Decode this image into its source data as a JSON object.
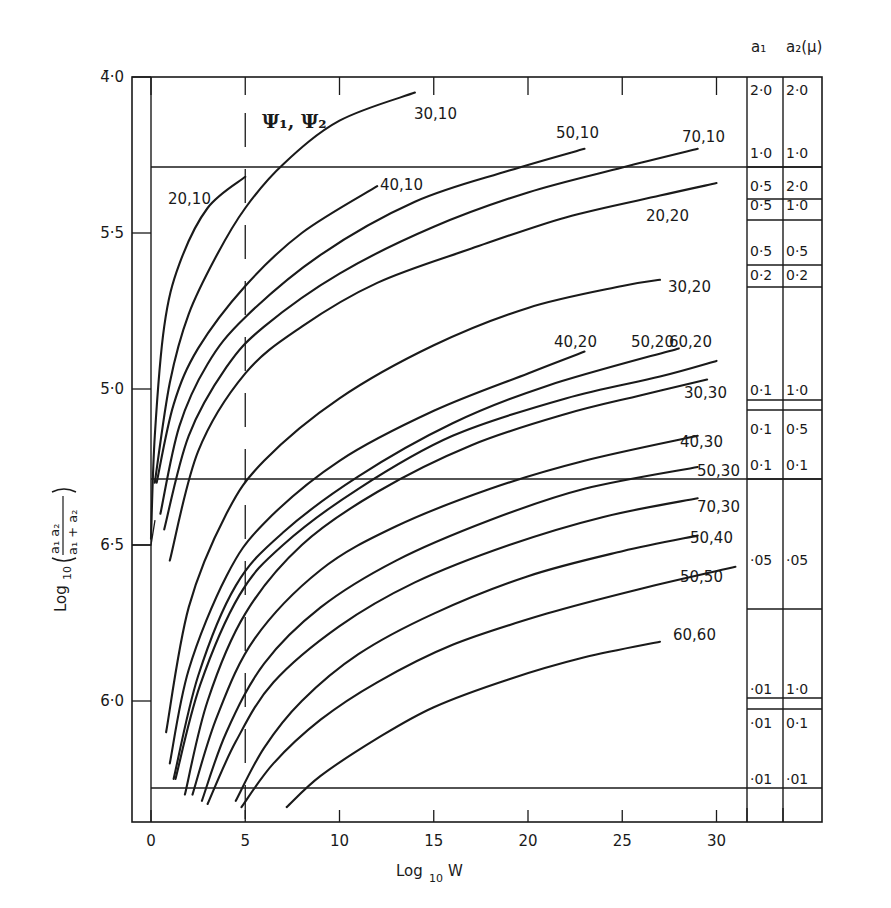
{
  "chart_data": {
    "type": "line",
    "title": "",
    "xlabel": "Log10 W",
    "ylabel": "Log10(a1 a2 / (a1 + a2))",
    "xlim": [
      0,
      33
    ],
    "x_ticks": [
      0,
      5,
      10,
      15,
      20,
      25,
      30
    ],
    "x_tick_labels": [
      "0",
      "5",
      "10",
      "15",
      "20",
      "25",
      "30"
    ],
    "y_ticks": [
      {
        "value": -4.0,
        "label": "4̄·0"
      },
      {
        "value": -4.5,
        "label": "5̄·5"
      },
      {
        "value": -5.0,
        "label": "5̄·0"
      },
      {
        "value": -5.5,
        "label": "6̄·5"
      },
      {
        "value": -6.0,
        "label": "6̄·0"
      }
    ],
    "ylim": [
      -6.39,
      -4.0
    ],
    "annotation": "Ψ1, Ψ2",
    "dashed_vertical_line_x": 5,
    "horizontal_reference_lines_y": [
      -4.29,
      -5.29,
      -6.28
    ],
    "series": [
      {
        "name": "20,10",
        "label": "20,10",
        "points": [
          [
            0,
            -5.48
          ],
          [
            0.2,
            -5.15
          ],
          [
            0.7,
            -4.8
          ],
          [
            1.5,
            -4.6
          ],
          [
            3,
            -4.42
          ],
          [
            5,
            -4.32
          ]
        ]
      },
      {
        "name": "30,10",
        "label": "30,10",
        "points": [
          [
            0.2,
            -5.3
          ],
          [
            1,
            -4.98
          ],
          [
            2,
            -4.76
          ],
          [
            3.5,
            -4.57
          ],
          [
            5,
            -4.42
          ],
          [
            7,
            -4.28
          ],
          [
            10,
            -4.14
          ],
          [
            14,
            -4.05
          ]
        ]
      },
      {
        "name": "40,10",
        "label": "40,10",
        "points": [
          [
            0.3,
            -5.3
          ],
          [
            1.2,
            -5.05
          ],
          [
            2.5,
            -4.87
          ],
          [
            5,
            -4.67
          ],
          [
            8,
            -4.5
          ],
          [
            12,
            -4.35
          ]
        ]
      },
      {
        "name": "50,10",
        "label": "50,10",
        "points": [
          [
            0.5,
            -5.4
          ],
          [
            1.5,
            -5.12
          ],
          [
            3,
            -4.92
          ],
          [
            5,
            -4.77
          ],
          [
            9,
            -4.57
          ],
          [
            14,
            -4.4
          ],
          [
            19,
            -4.3
          ],
          [
            23,
            -4.23
          ]
        ]
      },
      {
        "name": "70,10",
        "label": "70,10",
        "points": [
          [
            0.7,
            -5.45
          ],
          [
            2,
            -5.15
          ],
          [
            4,
            -4.93
          ],
          [
            6,
            -4.8
          ],
          [
            10,
            -4.63
          ],
          [
            15,
            -4.48
          ],
          [
            20,
            -4.37
          ],
          [
            25,
            -4.29
          ],
          [
            29,
            -4.23
          ]
        ]
      },
      {
        "name": "20,20",
        "label": "20,20",
        "points": [
          [
            1,
            -5.55
          ],
          [
            2.5,
            -5.2
          ],
          [
            5,
            -4.95
          ],
          [
            8,
            -4.8
          ],
          [
            12,
            -4.66
          ],
          [
            17,
            -4.55
          ],
          [
            22,
            -4.45
          ],
          [
            27,
            -4.38
          ],
          [
            30,
            -4.34
          ]
        ]
      },
      {
        "name": "30,20",
        "label": "30,20",
        "points": [
          [
            0.8,
            -6.1
          ],
          [
            2,
            -5.7
          ],
          [
            4,
            -5.4
          ],
          [
            6,
            -5.23
          ],
          [
            10,
            -5.03
          ],
          [
            15,
            -4.86
          ],
          [
            20,
            -4.74
          ],
          [
            25,
            -4.67
          ],
          [
            27,
            -4.65
          ]
        ]
      },
      {
        "name": "40,20",
        "label": "40,20",
        "points": [
          [
            1,
            -6.2
          ],
          [
            2,
            -5.9
          ],
          [
            4,
            -5.6
          ],
          [
            6,
            -5.43
          ],
          [
            10,
            -5.23
          ],
          [
            15,
            -5.07
          ],
          [
            20,
            -4.95
          ],
          [
            23,
            -4.88
          ]
        ]
      },
      {
        "name": "50,20",
        "label": "50,20",
        "points": [
          [
            1.2,
            -6.25
          ],
          [
            2.5,
            -5.92
          ],
          [
            4.5,
            -5.63
          ],
          [
            7,
            -5.46
          ],
          [
            11,
            -5.28
          ],
          [
            16,
            -5.11
          ],
          [
            21,
            -4.99
          ],
          [
            28,
            -4.87
          ]
        ]
      },
      {
        "name": "60,20",
        "label": "60,20",
        "points": [
          [
            1.3,
            -6.25
          ],
          [
            2.6,
            -5.95
          ],
          [
            4.7,
            -5.66
          ],
          [
            7,
            -5.5
          ],
          [
            11,
            -5.32
          ],
          [
            16,
            -5.15
          ],
          [
            22,
            -5.03
          ],
          [
            27,
            -4.96
          ],
          [
            30,
            -4.91
          ]
        ]
      },
      {
        "name": "30,30",
        "label": "30,30",
        "points": [
          [
            1.8,
            -6.3
          ],
          [
            3,
            -6.0
          ],
          [
            5,
            -5.72
          ],
          [
            8,
            -5.5
          ],
          [
            12,
            -5.33
          ],
          [
            17,
            -5.18
          ],
          [
            22,
            -5.08
          ],
          [
            26,
            -5.02
          ],
          [
            29.5,
            -4.97
          ]
        ]
      },
      {
        "name": "40,30",
        "label": "40,30",
        "points": [
          [
            2.2,
            -6.3
          ],
          [
            3.5,
            -6.05
          ],
          [
            5.5,
            -5.8
          ],
          [
            9,
            -5.58
          ],
          [
            13,
            -5.44
          ],
          [
            18,
            -5.32
          ],
          [
            23,
            -5.23
          ],
          [
            29,
            -5.15
          ]
        ]
      },
      {
        "name": "50,30",
        "label": "50,30",
        "points": [
          [
            2.7,
            -6.32
          ],
          [
            4,
            -6.1
          ],
          [
            6,
            -5.88
          ],
          [
            9,
            -5.7
          ],
          [
            13,
            -5.55
          ],
          [
            18,
            -5.42
          ],
          [
            23,
            -5.32
          ],
          [
            29,
            -5.25
          ]
        ]
      },
      {
        "name": "70,30",
        "label": "70,30",
        "points": [
          [
            3,
            -6.33
          ],
          [
            4.5,
            -6.13
          ],
          [
            6.5,
            -5.94
          ],
          [
            10,
            -5.76
          ],
          [
            14,
            -5.62
          ],
          [
            19,
            -5.5
          ],
          [
            24,
            -5.41
          ],
          [
            29,
            -5.35
          ]
        ]
      },
      {
        "name": "50,40",
        "label": "50,40",
        "points": [
          [
            4.5,
            -6.32
          ],
          [
            6,
            -6.15
          ],
          [
            8,
            -6.0
          ],
          [
            11,
            -5.85
          ],
          [
            15,
            -5.72
          ],
          [
            20,
            -5.6
          ],
          [
            25,
            -5.52
          ],
          [
            29,
            -5.47
          ]
        ]
      },
      {
        "name": "50,50",
        "label": "50,50",
        "points": [
          [
            4.8,
            -6.34
          ],
          [
            6.5,
            -6.2
          ],
          [
            9,
            -6.06
          ],
          [
            12,
            -5.94
          ],
          [
            16,
            -5.82
          ],
          [
            21,
            -5.72
          ],
          [
            26,
            -5.64
          ],
          [
            31,
            -5.57
          ]
        ]
      },
      {
        "name": "60,60",
        "label": "60,60",
        "points": [
          [
            7.2,
            -6.34
          ],
          [
            9,
            -6.24
          ],
          [
            12,
            -6.12
          ],
          [
            15,
            -6.02
          ],
          [
            19,
            -5.93
          ],
          [
            23,
            -5.86
          ],
          [
            27,
            -5.81
          ]
        ]
      }
    ],
    "side_table": {
      "headers": [
        "a1",
        "a2 (μ)"
      ],
      "rows": [
        {
          "a1": "2·0",
          "a2": "2·0"
        },
        {
          "a1": "1·0",
          "a2": "1·0"
        },
        {
          "a1": "0·5",
          "a2": "2·0"
        },
        {
          "a1": "0·5",
          "a2": "1·0"
        },
        {
          "a1": "0·5",
          "a2": "0·5"
        },
        {
          "a1": "0·2",
          "a2": "0·2"
        },
        {
          "a1": "0·1",
          "a2": "1·0"
        },
        {
          "a1": "0·1",
          "a2": "0·5"
        },
        {
          "a1": "0·1",
          "a2": "0·1"
        },
        {
          "a1": "·05",
          "a2": "·05"
        },
        {
          "a1": "·01",
          "a2": "1·0"
        },
        {
          "a1": "·01",
          "a2": "0·1"
        },
        {
          "a1": "·01",
          "a2": "·01"
        }
      ]
    }
  },
  "labels": {
    "x_axis_title_main": "Log",
    "x_axis_title_sub": "10",
    "x_axis_title_var": "W",
    "y_axis_title_main": "Log",
    "y_axis_title_sub": "10",
    "y_num": "a₁ a₂",
    "y_den": "a₁ + a₂",
    "psi": "Ψ₁, Ψ₂",
    "table_head_a1": "a₁",
    "table_head_a2": "a₂(μ)"
  },
  "style": {
    "ink": "#1a1a1a",
    "background": "#ffffff"
  }
}
